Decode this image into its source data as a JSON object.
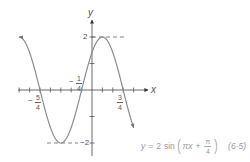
{
  "chart_data": {
    "type": "line",
    "title": "",
    "function": "y = 2 sin(πx + π/4)",
    "equation": {
      "lhs": "y",
      "eq": "=",
      "coef": "2",
      "func": "sin",
      "arg_term": "πx",
      "plus": "+",
      "frac_num": "π",
      "frac_den": "4",
      "tag": "(6-5)"
    },
    "xlabel": "x",
    "ylabel": "y",
    "xlim": [
      -1.75,
      1.0
    ],
    "ylim": [
      -2,
      2
    ],
    "x_tick_step": 0.25,
    "y_tick_step": 1,
    "labeled_x_ticks": [
      {
        "value": -1.25,
        "sign": "−",
        "num": "5",
        "den": "4"
      },
      {
        "value": -0.25,
        "sign": "−",
        "num": "1",
        "den": "4"
      },
      {
        "value": 0.75,
        "sign": "",
        "num": "3",
        "den": "4"
      }
    ],
    "labeled_y_ticks": [
      {
        "value": 2,
        "label": "2"
      },
      {
        "value": -2,
        "label": "−2"
      }
    ],
    "reference_lines": [
      {
        "type": "dashed-horizontal",
        "y": 2,
        "label": "max"
      },
      {
        "type": "dashed-horizontal",
        "y": -2,
        "label": "min"
      }
    ],
    "key_points": [
      {
        "x": -1.75,
        "y": 2,
        "note": "max (left end, arrow)"
      },
      {
        "x": -1.25,
        "y": 0,
        "note": "zero"
      },
      {
        "x": -0.75,
        "y": -2,
        "note": "min"
      },
      {
        "x": -0.25,
        "y": 0,
        "note": "zero"
      },
      {
        "x": 0,
        "y": 1.414,
        "note": "y-intercept"
      },
      {
        "x": 0.25,
        "y": 2,
        "note": "max"
      },
      {
        "x": 0.75,
        "y": 0,
        "note": "zero"
      },
      {
        "x": 1.0,
        "y": -1.414,
        "note": "right end, arrow"
      }
    ],
    "grid": false,
    "legend": null,
    "colors": {
      "curve": "#8c8c8c",
      "axes": "#555555",
      "dashes": "#666666",
      "equation": "#9a9a9a"
    }
  }
}
